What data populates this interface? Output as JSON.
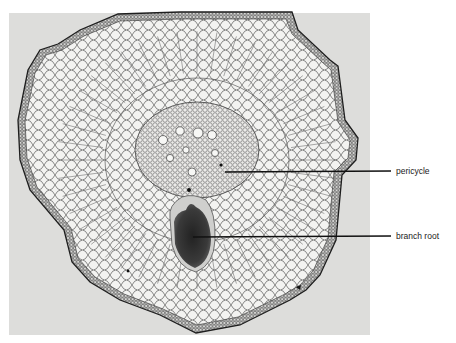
{
  "figure": {
    "photo_tone": "#dcdcda",
    "tissue_fill": "#f2f2f0",
    "cell_wall_color": "#3a3a3a",
    "branch_root_color": "#2c2c2c",
    "pointer_color": "#111111"
  },
  "labels": [
    {
      "id": "pericycle",
      "text": "pericycle"
    },
    {
      "id": "branch-root",
      "text": "branch root"
    }
  ]
}
